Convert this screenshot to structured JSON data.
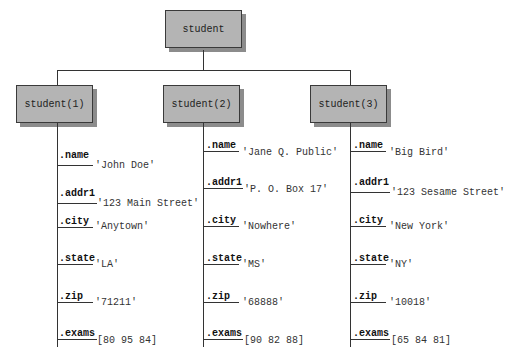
{
  "root": {
    "label": "student"
  },
  "students": [
    {
      "label": "student(1)",
      "fields": [
        {
          "name": ".name",
          "value": "'John Doe'"
        },
        {
          "name": ".addr1",
          "value": "'123 Main Street'"
        },
        {
          "name": ".city",
          "value": "'Anytown'"
        },
        {
          "name": ".state",
          "value": "'LA'"
        },
        {
          "name": ".zip",
          "value": "'71211'"
        },
        {
          "name": ".exams",
          "value": "[80 95 84]"
        }
      ]
    },
    {
      "label": "student(2)",
      "fields": [
        {
          "name": ".name",
          "value": "'Jane Q. Public'"
        },
        {
          "name": ".addr1",
          "value": "'P. O. Box 17'"
        },
        {
          "name": ".city",
          "value": "'Nowhere'"
        },
        {
          "name": ".state",
          "value": "'MS'"
        },
        {
          "name": ".zip",
          "value": "'68888'"
        },
        {
          "name": ".exams",
          "value": "[90 82 88]"
        }
      ]
    },
    {
      "label": "student(3)",
      "fields": [
        {
          "name": ".name",
          "value": "'Big Bird'"
        },
        {
          "name": ".addr1",
          "value": "'123 Sesame Street'"
        },
        {
          "name": ".city",
          "value": "'New York'"
        },
        {
          "name": ".state",
          "value": "'NY'"
        },
        {
          "name": ".zip",
          "value": "'10018'"
        },
        {
          "name": ".exams",
          "value": "[65 84 81]"
        }
      ]
    }
  ]
}
